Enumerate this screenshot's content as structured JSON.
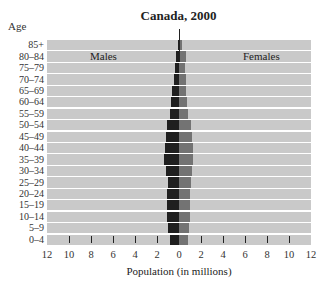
{
  "title": "Canada, 2000",
  "y_axis_title": "Age",
  "x_axis_title": "Population (in millions)",
  "labels": {
    "males": "Males",
    "females": "Females"
  },
  "x_tick_labels": [
    "12",
    "10",
    "8",
    "6",
    "4",
    "2",
    "0",
    "2",
    "4",
    "6",
    "8",
    "10",
    "12"
  ],
  "colors": {
    "background": "#c9c9c9",
    "males": "#1f1f1f",
    "females": "#737373",
    "row_separator": "#ffffff"
  },
  "chart_data": {
    "type": "bar",
    "subtype": "population-pyramid",
    "title": "Canada, 2000",
    "xlabel": "Population (in millions)",
    "ylabel": "Age",
    "xlim": [
      -12,
      12
    ],
    "x_ticks": [
      -12,
      -10,
      -8,
      -6,
      -4,
      -2,
      0,
      2,
      4,
      6,
      8,
      10,
      12
    ],
    "grid": false,
    "legend": "inline labels: Males (left), Females (right)",
    "categories": [
      "85+",
      "80–84",
      "75–79",
      "70–74",
      "65–69",
      "60–64",
      "55–59",
      "50–54",
      "45–49",
      "40–44",
      "35–39",
      "30–34",
      "25–29",
      "20–24",
      "15–19",
      "10–14",
      "5–9",
      "0–4"
    ],
    "series": [
      {
        "name": "Males",
        "values": [
          0.1,
          0.3,
          0.4,
          0.5,
          0.6,
          0.7,
          0.8,
          1.1,
          1.15,
          1.25,
          1.35,
          1.15,
          1.0,
          1.05,
          1.05,
          1.05,
          1.0,
          0.85
        ]
      },
      {
        "name": "Females",
        "values": [
          0.25,
          0.6,
          0.55,
          0.6,
          0.65,
          0.7,
          0.85,
          1.1,
          1.2,
          1.25,
          1.3,
          1.15,
          1.05,
          1.0,
          1.0,
          1.0,
          0.95,
          0.8
        ]
      }
    ]
  }
}
